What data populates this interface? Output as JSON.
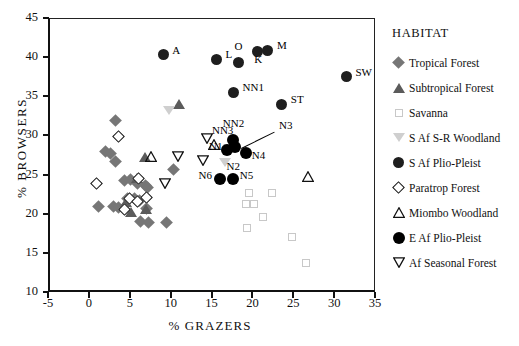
{
  "chart_data": {
    "type": "scatter",
    "title": "",
    "xlabel": "% GRAZERS",
    "ylabel": "% BROWSERS",
    "xlim": [
      -5,
      35
    ],
    "ylim": [
      10,
      45
    ],
    "xticks": [
      "-5",
      "0",
      "5",
      "10",
      "15",
      "20",
      "25",
      "30",
      "35"
    ],
    "yticks": [
      "10",
      "15",
      "20",
      "25",
      "30",
      "35",
      "40",
      "45"
    ],
    "grid": false,
    "legend_position": "right",
    "legend_title": "HABITAT",
    "series": [
      {
        "name": "Tropical Forest",
        "marker": "filled-diamond",
        "color": "#767676",
        "points": [
          {
            "x": 3.3,
            "y": 31.9
          },
          {
            "x": 2.0,
            "y": 27.9
          },
          {
            "x": 2.6,
            "y": 27.7
          },
          {
            "x": 3.2,
            "y": 26.7
          },
          {
            "x": 4.3,
            "y": 24.3
          },
          {
            "x": 5.1,
            "y": 24.4
          },
          {
            "x": 6.0,
            "y": 23.8
          },
          {
            "x": 6.9,
            "y": 23.6
          },
          {
            "x": 7.2,
            "y": 23.3
          },
          {
            "x": 10.3,
            "y": 25.6
          },
          {
            "x": 4.7,
            "y": 22.0
          },
          {
            "x": 5.6,
            "y": 21.9
          },
          {
            "x": 6.2,
            "y": 21.7
          },
          {
            "x": 3.0,
            "y": 20.9
          },
          {
            "x": 3.6,
            "y": 20.8
          },
          {
            "x": 4.2,
            "y": 20.7
          },
          {
            "x": 7.0,
            "y": 20.7
          },
          {
            "x": 1.2,
            "y": 20.9
          },
          {
            "x": 6.3,
            "y": 19.0
          },
          {
            "x": 7.3,
            "y": 18.9
          },
          {
            "x": 9.5,
            "y": 18.9
          }
        ]
      },
      {
        "name": "Subtropical Forest",
        "marker": "filled-triangle-up",
        "color": "#5b5b5b",
        "points": [
          {
            "x": 11.0,
            "y": 34.0
          },
          {
            "x": 6.9,
            "y": 27.2
          },
          {
            "x": 5.9,
            "y": 24.6
          },
          {
            "x": 4.6,
            "y": 21.5
          },
          {
            "x": 5.2,
            "y": 20.2
          },
          {
            "x": 7.0,
            "y": 20.6
          }
        ]
      },
      {
        "name": "Savanna",
        "marker": "open-square",
        "color": "#c8c8c8",
        "points": [
          {
            "x": 19.6,
            "y": 22.6
          },
          {
            "x": 22.4,
            "y": 22.6
          },
          {
            "x": 19.2,
            "y": 21.2
          },
          {
            "x": 20.2,
            "y": 21.2
          },
          {
            "x": 21.3,
            "y": 19.6
          },
          {
            "x": 19.3,
            "y": 18.2
          },
          {
            "x": 24.8,
            "y": 17.0
          },
          {
            "x": 26.5,
            "y": 13.7
          }
        ]
      },
      {
        "name": "S Af S-R Woodland",
        "marker": "filled-triangle-down-light",
        "color": "#cfcfcf",
        "points": [
          {
            "x": 9.8,
            "y": 33.2
          },
          {
            "x": 17.1,
            "y": 28.3
          },
          {
            "x": 16.6,
            "y": 26.5
          }
        ]
      },
      {
        "name": "S Af Plio-Pleist",
        "marker": "filled-circle-dark",
        "color": "#1e1e1e",
        "points": [
          {
            "x": 9.1,
            "y": 40.3
          },
          {
            "x": 15.6,
            "y": 39.7
          },
          {
            "x": 18.3,
            "y": 39.3
          },
          {
            "x": 20.6,
            "y": 40.7
          },
          {
            "x": 21.9,
            "y": 40.9
          },
          {
            "x": 17.7,
            "y": 35.5
          },
          {
            "x": 23.6,
            "y": 34.0
          },
          {
            "x": 31.5,
            "y": 37.5
          }
        ]
      },
      {
        "name": "Paratrop Forest",
        "marker": "open-diamond",
        "color": "#111111",
        "points": [
          {
            "x": 3.6,
            "y": 29.9
          },
          {
            "x": 0.9,
            "y": 23.9
          },
          {
            "x": 6.1,
            "y": 24.5
          },
          {
            "x": 5.0,
            "y": 21.9
          },
          {
            "x": 6.0,
            "y": 21.6
          },
          {
            "x": 4.4,
            "y": 20.6
          },
          {
            "x": 7.1,
            "y": 22.1
          }
        ]
      },
      {
        "name": "Miombo Woodland",
        "marker": "open-triangle-up",
        "color": "#111111",
        "points": [
          {
            "x": 7.6,
            "y": 27.3
          },
          {
            "x": 15.3,
            "y": 28.8
          },
          {
            "x": 26.8,
            "y": 24.7
          }
        ]
      },
      {
        "name": "E Af Plio-Pleist",
        "marker": "filled-circle-black",
        "color": "#000000",
        "points": [
          {
            "x": 17.6,
            "y": 29.4
          },
          {
            "x": 17.9,
            "y": 28.5
          },
          {
            "x": 16.9,
            "y": 28.2
          },
          {
            "x": 19.2,
            "y": 27.8
          },
          {
            "x": 16.1,
            "y": 24.4
          },
          {
            "x": 17.6,
            "y": 24.4
          }
        ]
      },
      {
        "name": "Af Seasonal Forest",
        "marker": "open-triangle-down",
        "color": "#111111",
        "points": [
          {
            "x": 10.9,
            "y": 27.3
          },
          {
            "x": 9.3,
            "y": 23.8
          },
          {
            "x": 14.0,
            "y": 26.8
          },
          {
            "x": 14.4,
            "y": 29.6
          }
        ]
      }
    ],
    "annotations": [
      {
        "label": "A",
        "x": 9.1,
        "y": 40.3,
        "dx": 9,
        "dy": -5
      },
      {
        "label": "L",
        "x": 15.6,
        "y": 39.7,
        "dx": 9,
        "dy": -5
      },
      {
        "label": "O",
        "x": 18.3,
        "y": 39.3,
        "dx": -4,
        "dy": -17
      },
      {
        "label": "K",
        "x": 20.6,
        "y": 40.7,
        "dx": -3,
        "dy": 7
      },
      {
        "label": "M",
        "x": 21.9,
        "y": 40.9,
        "dx": 9,
        "dy": -5
      },
      {
        "label": "NN1",
        "x": 17.7,
        "y": 35.5,
        "dx": 9,
        "dy": -5
      },
      {
        "label": "ST",
        "x": 23.6,
        "y": 34.0,
        "dx": 9,
        "dy": -5
      },
      {
        "label": "SW",
        "x": 31.5,
        "y": 37.5,
        "dx": 9,
        "dy": -5
      },
      {
        "label": "NN2",
        "x": 17.6,
        "y": 29.4,
        "dx": -10,
        "dy": -17
      },
      {
        "label": "NN3",
        "x": 15.3,
        "y": 28.8,
        "dx": -2,
        "dy": -15
      },
      {
        "label": "N1",
        "x": 16.9,
        "y": 28.2,
        "dx": -18,
        "dy": -4
      },
      {
        "label": "N2",
        "x": 16.6,
        "y": 26.5,
        "dx": 2,
        "dy": 3
      },
      {
        "label": "N3",
        "x": 22.9,
        "y": 30.6,
        "dx": 3,
        "dy": -6
      },
      {
        "label": "N4",
        "x": 19.2,
        "y": 27.8,
        "dx": 6,
        "dy": 2
      },
      {
        "label": "N5",
        "x": 17.6,
        "y": 24.4,
        "dx": 7,
        "dy": -4
      },
      {
        "label": "N6",
        "x": 16.1,
        "y": 24.4,
        "dx": -22,
        "dy": -4
      }
    ],
    "leader_lines": [
      {
        "x1": 18.6,
        "y1": 28.4,
        "x2": 22.7,
        "y2": 30.5
      }
    ]
  },
  "legend": {
    "title": "HABITAT",
    "items": [
      {
        "label": "Tropical Forest",
        "marker": "filled-diamond"
      },
      {
        "label": "Subtropical Forest",
        "marker": "filled-triangle-up"
      },
      {
        "label": "Savanna",
        "marker": "open-square"
      },
      {
        "label": "S Af S-R Woodland",
        "marker": "filled-triangle-down-light"
      },
      {
        "label": "S Af Plio-Pleist",
        "marker": "filled-circle-dark"
      },
      {
        "label": "Paratrop Forest",
        "marker": "open-diamond"
      },
      {
        "label": "Miombo Woodland",
        "marker": "open-triangle-up"
      },
      {
        "label": "E Af Plio-Pleist",
        "marker": "filled-circle-black"
      },
      {
        "label": "Af Seasonal Forest",
        "marker": "open-triangle-down"
      }
    ]
  }
}
